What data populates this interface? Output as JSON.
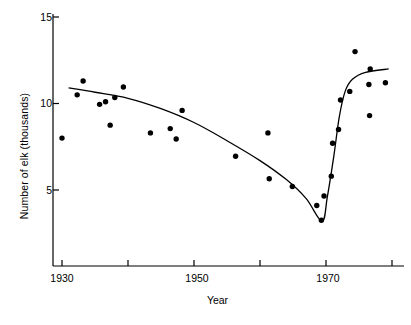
{
  "chart_data": {
    "type": "scatter",
    "title": "",
    "xlabel": "Year",
    "ylabel": "Number of elk (thousands)",
    "xlim": [
      1930,
      1982
    ],
    "ylim": [
      0,
      15
    ],
    "xticks": [
      1930,
      1940,
      1950,
      1960,
      1970,
      1980
    ],
    "xtick_labels": [
      "1930",
      "",
      "1950",
      "",
      "1970",
      ""
    ],
    "yticks": [
      5,
      10,
      15
    ],
    "ytick_labels": [
      "5",
      "10",
      "15"
    ],
    "grid": false,
    "legend": null,
    "series": [
      {
        "name": "Elk counts",
        "marker": "filled-circle",
        "marker_color": "#000000",
        "points": [
          {
            "x": 1930.0,
            "y": 8.0
          },
          {
            "x": 1933.2,
            "y": 11.3
          },
          {
            "x": 1932.3,
            "y": 10.5
          },
          {
            "x": 1935.7,
            "y": 9.95
          },
          {
            "x": 1936.6,
            "y": 10.1
          },
          {
            "x": 1938.0,
            "y": 10.35
          },
          {
            "x": 1937.3,
            "y": 8.75
          },
          {
            "x": 1939.3,
            "y": 10.95
          },
          {
            "x": 1943.4,
            "y": 8.3
          },
          {
            "x": 1946.4,
            "y": 8.55
          },
          {
            "x": 1948.2,
            "y": 9.6
          },
          {
            "x": 1947.3,
            "y": 7.95
          },
          {
            "x": 1956.3,
            "y": 6.95
          },
          {
            "x": 1961.2,
            "y": 8.3
          },
          {
            "x": 1961.4,
            "y": 5.65
          },
          {
            "x": 1964.9,
            "y": 5.2
          },
          {
            "x": 1968.6,
            "y": 4.1
          },
          {
            "x": 1969.3,
            "y": 3.25
          },
          {
            "x": 1969.7,
            "y": 4.65
          },
          {
            "x": 1970.8,
            "y": 5.8
          },
          {
            "x": 1971.0,
            "y": 7.7
          },
          {
            "x": 1971.9,
            "y": 8.5
          },
          {
            "x": 1972.2,
            "y": 10.2
          },
          {
            "x": 1973.6,
            "y": 10.7
          },
          {
            "x": 1974.4,
            "y": 13.0
          },
          {
            "x": 1976.5,
            "y": 11.1
          },
          {
            "x": 1976.7,
            "y": 12.0
          },
          {
            "x": 1976.6,
            "y": 9.3
          },
          {
            "x": 1979.0,
            "y": 11.2
          }
        ]
      },
      {
        "name": "Fitted trend",
        "type": "line",
        "line_color": "#000000",
        "points": [
          {
            "x": 1931.0,
            "y": 10.9
          },
          {
            "x": 1935.0,
            "y": 10.65
          },
          {
            "x": 1940.0,
            "y": 10.3
          },
          {
            "x": 1945.0,
            "y": 9.7
          },
          {
            "x": 1950.0,
            "y": 8.9
          },
          {
            "x": 1955.0,
            "y": 7.85
          },
          {
            "x": 1960.0,
            "y": 6.7
          },
          {
            "x": 1964.0,
            "y": 5.6
          },
          {
            "x": 1967.0,
            "y": 4.5
          },
          {
            "x": 1969.4,
            "y": 3.2
          },
          {
            "x": 1970.2,
            "y": 4.6
          },
          {
            "x": 1971.2,
            "y": 7.0
          },
          {
            "x": 1972.0,
            "y": 9.2
          },
          {
            "x": 1972.9,
            "y": 10.7
          },
          {
            "x": 1974.0,
            "y": 11.4
          },
          {
            "x": 1976.0,
            "y": 11.8
          },
          {
            "x": 1979.5,
            "y": 12.0
          }
        ]
      }
    ]
  },
  "axes": {
    "y_axis_name": "y-axis",
    "x_axis_name": "x-axis"
  },
  "caption": {
    "text": ""
  }
}
